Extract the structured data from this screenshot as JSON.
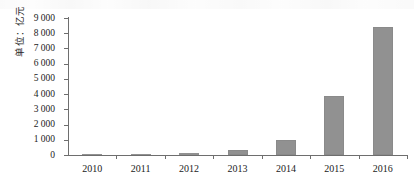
{
  "chart_data": {
    "type": "bar",
    "title": "",
    "xlabel": "",
    "ylabel": "单位：亿元",
    "categories": [
      "2010",
      "2011",
      "2012",
      "2013",
      "2014",
      "2015",
      "2016"
    ],
    "values": [
      30,
      70,
      130,
      330,
      1000,
      3850,
      8400
    ],
    "ylim": [
      0,
      9000
    ],
    "ytick_values": [
      0,
      1000,
      2000,
      3000,
      4000,
      5000,
      6000,
      7000,
      8000,
      9000
    ],
    "ytick_labels": [
      "0",
      "1 000",
      "2 000",
      "3 000",
      "4 000",
      "5 000",
      "6 000",
      "7 000",
      "8 000",
      "9 000"
    ],
    "grid": false,
    "legend": null,
    "series_color": "#919191",
    "axis_color": "#6e6e6e"
  }
}
